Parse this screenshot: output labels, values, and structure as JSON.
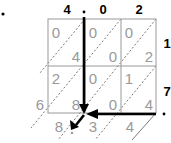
{
  "diagram": {
    "type": "lattice-multiplication",
    "multiplicand": {
      "digits": [
        "4",
        "0",
        "2"
      ],
      "decimal_after_index": 0
    },
    "multiplier": {
      "digits": [
        "1",
        "7"
      ],
      "decimal_after_index": 1
    },
    "cells": [
      [
        {
          "tens": "0",
          "ones": "4"
        },
        {
          "tens": "0",
          "ones": "0"
        },
        {
          "tens": "0",
          "ones": "2"
        }
      ],
      [
        {
          "tens": "2",
          "ones": "8"
        },
        {
          "tens": "0",
          "ones": "0"
        },
        {
          "tens": "1",
          "ones": "4"
        }
      ]
    ],
    "result_left": [
      "6"
    ],
    "result_bottom": [
      "8",
      "3",
      "4"
    ],
    "leading_dot": "•",
    "decimal_dot": "•",
    "colors": {
      "grid": "#999999",
      "digits": "#999999",
      "header": "#000000",
      "arrows": "#000000"
    }
  }
}
